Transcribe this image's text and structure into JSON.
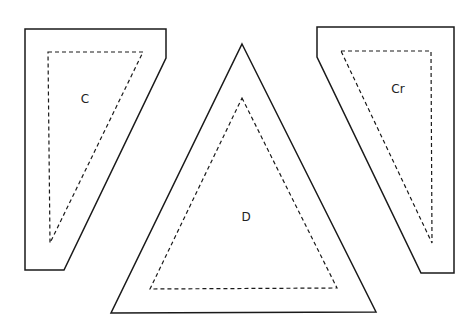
{
  "diagram": {
    "type": "sewing-pattern-pieces",
    "pieces": [
      {
        "id": "C",
        "label": "C",
        "cut_line": "25,29 166,29 166,58 64,270 25,270",
        "seam_line": "48,52 143,52 50,243",
        "label_pos": [
          85,
          103
        ]
      },
      {
        "id": "D",
        "label": "D",
        "cut_line": "242,44 376,312 111,313",
        "seam_line": "242,98 337,288 150,289",
        "label_pos": [
          246,
          221
        ]
      },
      {
        "id": "Cr",
        "label": "Cr",
        "cut_line": "317,27 454,27 454,273 421,273 317,57",
        "seam_line": "341,51 431,51 432,243",
        "label_pos": [
          398,
          93
        ]
      }
    ],
    "colors": {
      "background": "#ffffff",
      "line": "#1a1a1a"
    }
  }
}
